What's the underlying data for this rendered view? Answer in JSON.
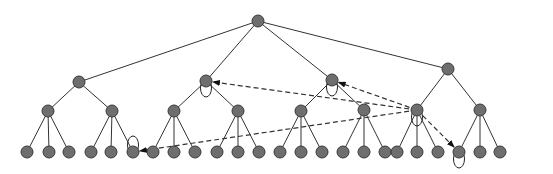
{
  "diagram": {
    "type": "tree",
    "colors": {
      "node_fill": "#6e6e6e",
      "node_stroke": "#3a3a3a",
      "edge": "#333333",
      "background": "#ffffff"
    },
    "node_radius": 6,
    "nodes": [
      {
        "id": "root",
        "x": 258,
        "y": 21
      },
      {
        "id": "a",
        "x": 79,
        "y": 82
      },
      {
        "id": "b",
        "x": 206,
        "y": 81
      },
      {
        "id": "c",
        "x": 332,
        "y": 80
      },
      {
        "id": "d",
        "x": 448,
        "y": 69
      },
      {
        "id": "a1",
        "x": 48,
        "y": 111
      },
      {
        "id": "a2",
        "x": 112,
        "y": 111
      },
      {
        "id": "b1",
        "x": 174,
        "y": 111
      },
      {
        "id": "b2",
        "x": 238,
        "y": 111
      },
      {
        "id": "c1",
        "x": 301,
        "y": 111
      },
      {
        "id": "c2",
        "x": 364,
        "y": 110
      },
      {
        "id": "d1",
        "x": 417,
        "y": 110
      },
      {
        "id": "d2",
        "x": 480,
        "y": 110
      },
      {
        "id": "a1-1",
        "x": 27,
        "y": 152
      },
      {
        "id": "a1-2",
        "x": 49,
        "y": 152
      },
      {
        "id": "a1-3",
        "x": 69,
        "y": 152
      },
      {
        "id": "a2-1",
        "x": 91,
        "y": 152
      },
      {
        "id": "a2-2",
        "x": 111,
        "y": 152
      },
      {
        "id": "a2-3",
        "x": 133,
        "y": 152
      },
      {
        "id": "b1-1",
        "x": 153,
        "y": 152
      },
      {
        "id": "b1-2",
        "x": 174,
        "y": 152
      },
      {
        "id": "b1-3",
        "x": 195,
        "y": 152
      },
      {
        "id": "b2-1",
        "x": 217,
        "y": 152
      },
      {
        "id": "b2-2",
        "x": 238,
        "y": 152
      },
      {
        "id": "b2-3",
        "x": 259,
        "y": 152
      },
      {
        "id": "c1-1",
        "x": 280,
        "y": 152
      },
      {
        "id": "c1-2",
        "x": 301,
        "y": 152
      },
      {
        "id": "c1-3",
        "x": 322,
        "y": 152
      },
      {
        "id": "c2-1",
        "x": 343,
        "y": 152
      },
      {
        "id": "c2-2",
        "x": 364,
        "y": 152
      },
      {
        "id": "c2-3",
        "x": 385,
        "y": 152
      },
      {
        "id": "d1-1",
        "x": 397,
        "y": 152
      },
      {
        "id": "d1-2",
        "x": 417,
        "y": 152
      },
      {
        "id": "d1-3",
        "x": 438,
        "y": 152
      },
      {
        "id": "d2-1",
        "x": 459,
        "y": 152
      },
      {
        "id": "d2-2",
        "x": 480,
        "y": 152
      },
      {
        "id": "d2-3",
        "x": 500,
        "y": 152
      }
    ],
    "edges": [
      [
        "root",
        "a"
      ],
      [
        "root",
        "b"
      ],
      [
        "root",
        "c"
      ],
      [
        "root",
        "d"
      ],
      [
        "a",
        "a1"
      ],
      [
        "a",
        "a2"
      ],
      [
        "b",
        "b1"
      ],
      [
        "b",
        "b2"
      ],
      [
        "c",
        "c1"
      ],
      [
        "c",
        "c2"
      ],
      [
        "d",
        "d1"
      ],
      [
        "d",
        "d2"
      ],
      [
        "a1",
        "a1-1"
      ],
      [
        "a1",
        "a1-2"
      ],
      [
        "a1",
        "a1-3"
      ],
      [
        "a2",
        "a2-1"
      ],
      [
        "a2",
        "a2-2"
      ],
      [
        "a2",
        "a2-3"
      ],
      [
        "b1",
        "b1-1"
      ],
      [
        "b1",
        "b1-2"
      ],
      [
        "b1",
        "b1-3"
      ],
      [
        "b2",
        "b2-1"
      ],
      [
        "b2",
        "b2-2"
      ],
      [
        "b2",
        "b2-3"
      ],
      [
        "c1",
        "c1-1"
      ],
      [
        "c1",
        "c1-2"
      ],
      [
        "c1",
        "c1-3"
      ],
      [
        "c2",
        "c2-1"
      ],
      [
        "c2",
        "c2-2"
      ],
      [
        "c2",
        "c2-3"
      ],
      [
        "d1",
        "d1-1"
      ],
      [
        "d1",
        "d1-2"
      ],
      [
        "d1",
        "d1-3"
      ],
      [
        "d2",
        "d2-1"
      ],
      [
        "d2",
        "d2-2"
      ],
      [
        "d2",
        "d2-3"
      ]
    ],
    "dashed_arrows": [
      {
        "from": "d1",
        "to": "b"
      },
      {
        "from": "d1",
        "to": "c"
      },
      {
        "from": "d1",
        "to": "a2-3"
      },
      {
        "from": "d1",
        "to": "d2-1"
      }
    ],
    "self_loops": [
      {
        "node": "b",
        "position": "below"
      },
      {
        "node": "c",
        "position": "below"
      },
      {
        "node": "d1",
        "position": "below"
      },
      {
        "node": "a2-3",
        "position": "above"
      },
      {
        "node": "d2-1",
        "position": "below"
      }
    ]
  }
}
